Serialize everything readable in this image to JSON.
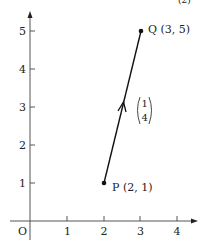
{
  "figure": {
    "corner_fragment": "(2)",
    "origin_label": "O",
    "x_ticks": [
      {
        "value": "1",
        "x": 67
      },
      {
        "value": "2",
        "x": 104
      },
      {
        "value": "3",
        "x": 140
      },
      {
        "value": "4",
        "x": 177
      }
    ],
    "y_ticks": [
      {
        "value": "1",
        "y": 183
      },
      {
        "value": "2",
        "y": 145
      },
      {
        "value": "3",
        "y": 107
      },
      {
        "value": "4",
        "y": 69
      },
      {
        "value": "5",
        "y": 31
      }
    ],
    "points": {
      "P": {
        "label": "P (2, 1)",
        "x": 2,
        "y": 1
      },
      "Q": {
        "label": "Q (3, 5)",
        "x": 3,
        "y": 5
      }
    },
    "vector": {
      "top": "1",
      "bottom": "4"
    },
    "colors": {
      "ink": "#222222",
      "axis": "#555555",
      "background": "#ffffff"
    }
  }
}
